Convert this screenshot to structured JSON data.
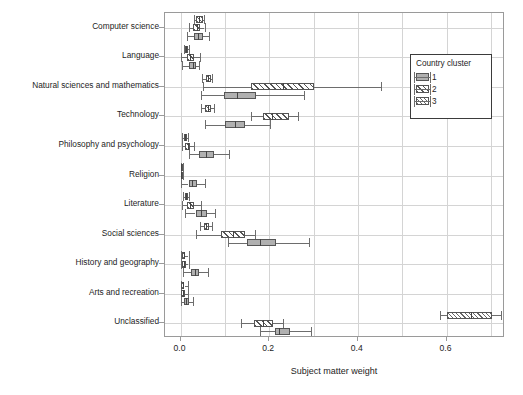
{
  "chart_data": {
    "type": "box",
    "title": "",
    "xlabel": "Subject matter weight",
    "ylabel": "",
    "xlim": [
      -0.035,
      0.732
    ],
    "xticks": [
      0.0,
      0.2,
      0.4,
      0.6
    ],
    "xticklabels": [
      "0.0",
      "0.2",
      "0.4",
      "0.6"
    ],
    "grid": true,
    "orientation": "horizontal",
    "legend": {
      "title": "Country cluster",
      "position": "top-right",
      "entries": [
        {
          "label": "1",
          "fill": "solid-gray",
          "color": "#b0b0b0"
        },
        {
          "label": "2",
          "fill": "diagonal-hatch",
          "color": "#ffffff"
        },
        {
          "label": "3",
          "fill": "cross-hatch",
          "color": "#ffffff"
        }
      ]
    },
    "categories": [
      "Computer science",
      "Language",
      "Natural sciences and mathematics",
      "Technology",
      "Philosophy and psychology",
      "Religion",
      "Literature",
      "Social sciences",
      "History and geography",
      "Arts and recreation",
      "Unclassified"
    ],
    "series": [
      {
        "name": "3",
        "cluster": 3,
        "boxes": [
          {
            "category": "Computer science",
            "whisker_low": 0.03,
            "q1": 0.034,
            "median": 0.042,
            "q3": 0.05,
            "whisker_high": 0.053
          },
          {
            "category": "Language",
            "whisker_low": 0.008,
            "q1": 0.01,
            "median": 0.013,
            "q3": 0.017,
            "whisker_high": 0.02
          },
          {
            "category": "Natural sciences and mathematics",
            "whisker_low": 0.048,
            "q1": 0.058,
            "median": 0.062,
            "q3": 0.068,
            "whisker_high": 0.07
          },
          {
            "category": "Technology",
            "whisker_low": 0.046,
            "q1": 0.055,
            "median": 0.061,
            "q3": 0.068,
            "whisker_high": 0.076
          },
          {
            "category": "Philosophy and psychology",
            "whisker_low": 0.004,
            "q1": 0.007,
            "median": 0.01,
            "q3": 0.014,
            "whisker_high": 0.016
          },
          {
            "category": "Religion",
            "whisker_low": 0.0,
            "q1": 0.001,
            "median": 0.002,
            "q3": 0.004,
            "whisker_high": 0.006
          },
          {
            "category": "Literature",
            "whisker_low": 0.006,
            "q1": 0.01,
            "median": 0.013,
            "q3": 0.017,
            "whisker_high": 0.02
          },
          {
            "category": "Social sciences",
            "whisker_low": 0.044,
            "q1": 0.052,
            "median": 0.058,
            "q3": 0.065,
            "whisker_high": 0.072
          },
          {
            "category": "History and geography",
            "whisker_low": 0.0,
            "q1": 0.004,
            "median": 0.007,
            "q3": 0.011,
            "whisker_high": 0.018
          },
          {
            "category": "Arts and recreation",
            "whisker_low": 0.0,
            "q1": 0.002,
            "median": 0.005,
            "q3": 0.009,
            "whisker_high": 0.016
          },
          {
            "category": "Unclassified",
            "whisker_low": 0.585,
            "q1": 0.602,
            "median": 0.655,
            "q3": 0.702,
            "whisker_high": 0.722
          }
        ]
      },
      {
        "name": "2",
        "cluster": 2,
        "boxes": [
          {
            "category": "Computer science",
            "whisker_low": 0.018,
            "q1": 0.028,
            "median": 0.036,
            "q3": 0.044,
            "whisker_high": 0.054
          },
          {
            "category": "Language",
            "whisker_low": 0.0,
            "q1": 0.014,
            "median": 0.022,
            "q3": 0.03,
            "whisker_high": 0.044
          },
          {
            "category": "Natural sciences and mathematics",
            "whisker_low": 0.05,
            "q1": 0.16,
            "median": 0.232,
            "q3": 0.302,
            "whisker_high": 0.452
          },
          {
            "category": "Technology",
            "whisker_low": 0.16,
            "q1": 0.186,
            "median": 0.206,
            "q3": 0.245,
            "whisker_high": 0.265
          },
          {
            "category": "Philosophy and psychology",
            "whisker_low": 0.004,
            "q1": 0.01,
            "median": 0.016,
            "q3": 0.022,
            "whisker_high": 0.03
          },
          {
            "category": "Religion",
            "whisker_low": 0.0,
            "q1": 0.0,
            "median": 0.001,
            "q3": 0.003,
            "whisker_high": 0.006
          },
          {
            "category": "Literature",
            "whisker_low": 0.004,
            "q1": 0.015,
            "median": 0.022,
            "q3": 0.03,
            "whisker_high": 0.046
          },
          {
            "category": "Social sciences",
            "whisker_low": 0.034,
            "q1": 0.092,
            "median": 0.118,
            "q3": 0.146,
            "whisker_high": 0.168
          },
          {
            "category": "History and geography",
            "whisker_low": 0.0,
            "q1": 0.004,
            "median": 0.008,
            "q3": 0.013,
            "whisker_high": 0.018
          },
          {
            "category": "Arts and recreation",
            "whisker_low": 0.0,
            "q1": 0.002,
            "median": 0.006,
            "q3": 0.011,
            "whisker_high": 0.016
          },
          {
            "category": "Unclassified",
            "whisker_low": 0.136,
            "q1": 0.166,
            "median": 0.186,
            "q3": 0.208,
            "whisker_high": 0.232
          }
        ]
      },
      {
        "name": "1",
        "cluster": 1,
        "boxes": [
          {
            "category": "Computer science",
            "whisker_low": 0.014,
            "q1": 0.03,
            "median": 0.04,
            "q3": 0.05,
            "whisker_high": 0.064
          },
          {
            "category": "Language",
            "whisker_low": 0.004,
            "q1": 0.02,
            "median": 0.027,
            "q3": 0.034,
            "whisker_high": 0.042
          },
          {
            "category": "Natural sciences and mathematics",
            "whisker_low": 0.046,
            "q1": 0.098,
            "median": 0.128,
            "q3": 0.17,
            "whisker_high": 0.278
          },
          {
            "category": "Technology",
            "whisker_low": 0.056,
            "q1": 0.1,
            "median": 0.122,
            "q3": 0.146,
            "whisker_high": 0.202
          },
          {
            "category": "Philosophy and psychology",
            "whisker_low": 0.018,
            "q1": 0.042,
            "median": 0.058,
            "q3": 0.076,
            "whisker_high": 0.11
          },
          {
            "category": "Religion",
            "whisker_low": 0.002,
            "q1": 0.018,
            "median": 0.026,
            "q3": 0.036,
            "whisker_high": 0.054
          },
          {
            "category": "Literature",
            "whisker_low": 0.01,
            "q1": 0.034,
            "median": 0.046,
            "q3": 0.06,
            "whisker_high": 0.078
          },
          {
            "category": "Social sciences",
            "whisker_low": 0.108,
            "q1": 0.15,
            "median": 0.18,
            "q3": 0.216,
            "whisker_high": 0.29
          },
          {
            "category": "History and geography",
            "whisker_low": 0.006,
            "q1": 0.024,
            "median": 0.032,
            "q3": 0.042,
            "whisker_high": 0.062
          },
          {
            "category": "Arts and recreation",
            "whisker_low": 0.0,
            "q1": 0.008,
            "median": 0.013,
            "q3": 0.019,
            "whisker_high": 0.028
          },
          {
            "category": "Unclassified",
            "whisker_low": 0.18,
            "q1": 0.214,
            "median": 0.222,
            "q3": 0.246,
            "whisker_high": 0.294
          }
        ]
      }
    ]
  }
}
